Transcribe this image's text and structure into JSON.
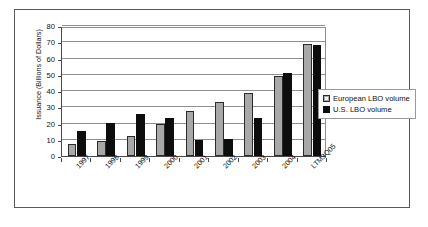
{
  "chart_data": {
    "type": "bar",
    "title": "",
    "subtitle": "",
    "xlabel": "",
    "ylabel": "Issuance (Billions of Dollars)",
    "categories": [
      "1997",
      "1998",
      "1999",
      "2000",
      "2001",
      "2002",
      "2003",
      "2004",
      "LTM3Q05"
    ],
    "series": [
      {
        "name": "European LBO volume",
        "color": "#a8a8a8",
        "values": [
          7.5,
          9.5,
          12.5,
          20.0,
          27.5,
          33.0,
          38.5,
          49.5,
          69.0
        ]
      },
      {
        "name": "U.S. LBO volume",
        "color": "#0d0d0d",
        "values": [
          15.5,
          20.5,
          26.0,
          23.5,
          10.0,
          10.5,
          23.5,
          51.0,
          68.5
        ]
      }
    ],
    "ylim": [
      0,
      80
    ],
    "yticks": [
      0,
      10,
      20,
      30,
      40,
      50,
      60,
      70,
      80
    ],
    "ytick_labels": [
      "0",
      "10",
      "20",
      "30",
      "40",
      "50",
      "60",
      "70",
      "80"
    ],
    "grid": "horizontal",
    "legend_position": "right",
    "legend_entries": [
      "European LBO volume",
      "U.S. LBO volume"
    ]
  },
  "figure": {
    "frame_color": "#5a5a5a",
    "background": "#ffffff",
    "axis_color": "#4a4a4a",
    "grid_color": "#8f8f8f"
  }
}
